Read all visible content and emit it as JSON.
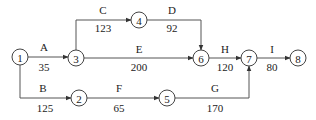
{
  "diagram": {
    "type": "activity-network",
    "nodes": [
      {
        "id": "1",
        "label": "1",
        "x": 20,
        "y": 57
      },
      {
        "id": "2",
        "label": "2",
        "x": 79,
        "y": 98
      },
      {
        "id": "3",
        "label": "3",
        "x": 76,
        "y": 58
      },
      {
        "id": "4",
        "label": "4",
        "x": 139,
        "y": 20
      },
      {
        "id": "5",
        "label": "5",
        "x": 167,
        "y": 98
      },
      {
        "id": "6",
        "label": "6",
        "x": 201,
        "y": 58
      },
      {
        "id": "7",
        "label": "7",
        "x": 249,
        "y": 58
      },
      {
        "id": "8",
        "label": "8",
        "x": 298,
        "y": 58
      }
    ],
    "edges": [
      {
        "from": "1",
        "to": "3",
        "name": "A",
        "weight": "35",
        "path": "M28,57 L68,57",
        "name_x": 44,
        "name_y": 51,
        "weight_x": 44,
        "weight_y": 71
      },
      {
        "from": "1",
        "to": "2",
        "name": "B",
        "weight": "125",
        "path": "M20,65 L20,98 L71,98",
        "name_x": 43,
        "name_y": 92,
        "weight_x": 45,
        "weight_y": 112
      },
      {
        "from": "3",
        "to": "4",
        "name": "C",
        "weight": "123",
        "path": "M76,50 L76,20 L131,20",
        "name_x": 103,
        "name_y": 14,
        "weight_x": 103,
        "weight_y": 32
      },
      {
        "from": "4",
        "to": "6",
        "name": "D",
        "weight": "92",
        "path": "M147,20 L201,20 L201,50",
        "name_x": 172,
        "name_y": 14,
        "weight_x": 172,
        "weight_y": 32
      },
      {
        "from": "3",
        "to": "6",
        "name": "E",
        "weight": "200",
        "path": "M84,58 L193,58",
        "name_x": 139,
        "name_y": 53,
        "weight_x": 139,
        "weight_y": 71
      },
      {
        "from": "2",
        "to": "5",
        "name": "F",
        "weight": "65",
        "path": "M87,98 L159,98",
        "name_x": 119,
        "name_y": 92,
        "weight_x": 119,
        "weight_y": 112
      },
      {
        "from": "5",
        "to": "7",
        "name": "G",
        "weight": "170",
        "path": "M175,98 L249,98 L249,66",
        "name_x": 215,
        "name_y": 92,
        "weight_x": 215,
        "weight_y": 112
      },
      {
        "from": "6",
        "to": "7",
        "name": "H",
        "weight": "120",
        "path": "M209,58 L241,58",
        "name_x": 225,
        "name_y": 53,
        "weight_x": 225,
        "weight_y": 71
      },
      {
        "from": "7",
        "to": "8",
        "name": "I",
        "weight": "80",
        "path": "M257,58 L290,58",
        "name_x": 272,
        "name_y": 53,
        "weight_x": 272,
        "weight_y": 71
      }
    ],
    "colors": {
      "stroke": "#444444",
      "text": "#222222",
      "background": "#ffffff"
    }
  }
}
